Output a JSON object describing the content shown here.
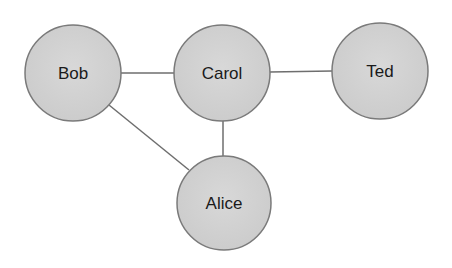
{
  "diagram": {
    "type": "graph",
    "colors": {
      "node_fill": "#d2d2d2",
      "node_stroke": "#7a7a7a",
      "edge": "#6e6e6e",
      "label": "#1a1a1a",
      "background": "#ffffff"
    },
    "nodes": [
      {
        "id": "bob",
        "label": "Bob",
        "cx": 73,
        "cy": 73,
        "r": 48
      },
      {
        "id": "carol",
        "label": "Carol",
        "cx": 222,
        "cy": 73,
        "r": 48
      },
      {
        "id": "ted",
        "label": "Ted",
        "cx": 380,
        "cy": 71,
        "r": 48
      },
      {
        "id": "alice",
        "label": "Alice",
        "cx": 224,
        "cy": 203,
        "r": 47
      }
    ],
    "edges": [
      {
        "from": "bob",
        "to": "carol"
      },
      {
        "from": "carol",
        "to": "ted"
      },
      {
        "from": "carol",
        "to": "alice"
      },
      {
        "from": "bob",
        "to": "alice"
      }
    ]
  }
}
